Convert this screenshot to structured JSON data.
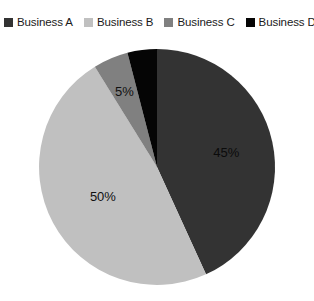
{
  "chart_data": {
    "type": "pie",
    "title": "",
    "categories": [
      "Business A",
      "Business B",
      "Business C",
      "Business D"
    ],
    "values": [
      45,
      50,
      5,
      0
    ],
    "value_labels": [
      "45%",
      "50%",
      "5%",
      ""
    ],
    "colors": [
      "#333333",
      "#c0c0c0",
      "#808080",
      "#050505"
    ],
    "legend_position": "top",
    "start_angle_deg": 0,
    "direction": "clockwise",
    "grid": false,
    "annotations": [
      {
        "text": "45%",
        "slice": "Business A"
      },
      {
        "text": "50%",
        "slice": "Business B"
      },
      {
        "text": "5%",
        "slice": "Business C"
      }
    ]
  },
  "legend": {
    "items": [
      {
        "label": "Business A",
        "color": "#333333",
        "swatch": "square-swatch-icon"
      },
      {
        "label": "Business B",
        "color": "#c0c0c0",
        "swatch": "square-swatch-icon"
      },
      {
        "label": "Business C",
        "color": "#808080",
        "swatch": "square-swatch-icon"
      },
      {
        "label": "Business D",
        "color": "#050505",
        "swatch": "square-swatch-icon"
      }
    ]
  },
  "pie": {
    "slices": [
      {
        "name": "Business A",
        "label": "45%",
        "color": "#333333"
      },
      {
        "name": "Business B",
        "label": "50%",
        "color": "#c0c0c0"
      },
      {
        "name": "Business C",
        "label": "5%",
        "color": "#808080"
      },
      {
        "name": "Business D",
        "label": "",
        "color": "#050505"
      }
    ]
  }
}
